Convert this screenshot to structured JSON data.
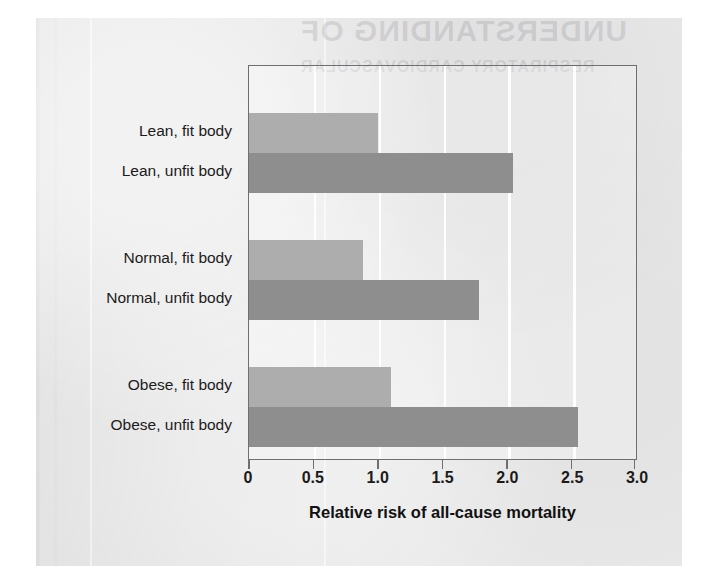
{
  "chart_data": {
    "type": "bar",
    "orientation": "horizontal",
    "title": "",
    "xlabel": "Relative risk of all-cause mortality",
    "ylabel": "",
    "xlim": [
      0,
      3.0
    ],
    "xticks": [
      "0",
      "0.5",
      "1.0",
      "1.5",
      "2.0",
      "2.5",
      "3.0"
    ],
    "xtick_values": [
      0,
      0.5,
      1.0,
      1.5,
      2.0,
      2.5,
      3.0
    ],
    "grid": "vertical white gridlines at every 0.5",
    "legend": "none",
    "categories": [
      "Lean, fit body",
      "Lean, unfit body",
      "Normal, fit body",
      "Normal, unfit body",
      "Obese, fit body",
      "Obese, unfit body"
    ],
    "values": [
      1.0,
      2.05,
      0.88,
      1.78,
      1.1,
      2.55
    ],
    "groups": [
      {
        "name": "Lean",
        "bars": [
          {
            "label": "Lean, fit body",
            "value": 1.0,
            "style": "fit",
            "color": "#adadad"
          },
          {
            "label": "Lean, unfit body",
            "value": 2.05,
            "style": "unfit",
            "color": "#8e8e8e"
          }
        ]
      },
      {
        "name": "Normal",
        "bars": [
          {
            "label": "Normal, fit body",
            "value": 0.88,
            "style": "fit",
            "color": "#adadad"
          },
          {
            "label": "Normal, unfit body",
            "value": 1.78,
            "style": "unfit",
            "color": "#8e8e8e"
          }
        ]
      },
      {
        "name": "Obese",
        "bars": [
          {
            "label": "Obese, fit body",
            "value": 1.1,
            "style": "fit",
            "color": "#adadad"
          },
          {
            "label": "Obese, unfit body",
            "value": 2.55,
            "style": "unfit",
            "color": "#8e8e8e"
          }
        ]
      }
    ],
    "colors": {
      "fit_bar": "#adadad",
      "unfit_bar": "#8e8e8e",
      "axis": "#6f6f6f",
      "text": "#1b1b1b",
      "page_background": "#e8e8e8",
      "gridline": "#ffffff"
    }
  },
  "ghost_text": {
    "title": "UNDERSTANDING OF",
    "subtitle": "RESPIRATORY CARDIOVASCULAR"
  }
}
